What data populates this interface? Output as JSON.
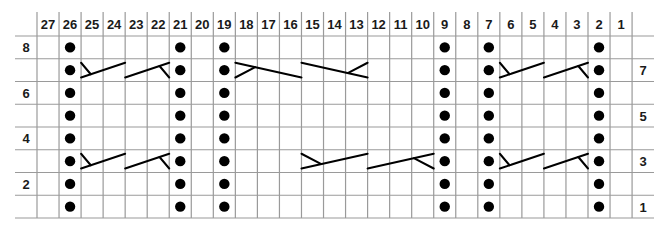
{
  "chart": {
    "title": "",
    "columns": [
      "27",
      "26",
      "25",
      "24",
      "23",
      "22",
      "21",
      "20",
      "19",
      "18",
      "17",
      "16",
      "15",
      "14",
      "13",
      "12",
      "11",
      "10",
      "9",
      "8",
      "7",
      "6",
      "5",
      "4",
      "3",
      "2",
      "1"
    ],
    "row_count": 8,
    "left_row_labels": [
      {
        "row": 8,
        "label": "8"
      },
      {
        "row": 6,
        "label": "6"
      },
      {
        "row": 4,
        "label": "4"
      },
      {
        "row": 2,
        "label": "2"
      }
    ],
    "right_row_labels": [
      {
        "row": 7,
        "label": "7"
      },
      {
        "row": 5,
        "label": "5"
      },
      {
        "row": 3,
        "label": "3"
      },
      {
        "row": 1,
        "label": "1"
      }
    ],
    "purl_columns": [
      26,
      21,
      19,
      9,
      7,
      2
    ],
    "purl_rows": [
      1,
      2,
      3,
      4,
      5,
      6,
      7,
      8
    ],
    "cables": [
      {
        "row": 7,
        "from_col": 25,
        "to_col": 24,
        "type": "right-twist-tick-left"
      },
      {
        "row": 7,
        "from_col": 23,
        "to_col": 22,
        "type": "right-twist-tick-right"
      },
      {
        "row": 7,
        "from_col": 18,
        "to_col": 16,
        "type": "left-cross-tick-left"
      },
      {
        "row": 7,
        "from_col": 15,
        "to_col": 13,
        "type": "left-cross-tick-right"
      },
      {
        "row": 7,
        "from_col": 6,
        "to_col": 5,
        "type": "right-twist-tick-left"
      },
      {
        "row": 7,
        "from_col": 4,
        "to_col": 3,
        "type": "right-twist-tick-right"
      },
      {
        "row": 3,
        "from_col": 25,
        "to_col": 24,
        "type": "right-twist-tick-left"
      },
      {
        "row": 3,
        "from_col": 23,
        "to_col": 22,
        "type": "right-twist-tick-right"
      },
      {
        "row": 3,
        "from_col": 15,
        "to_col": 13,
        "type": "right-cross-tick-left"
      },
      {
        "row": 3,
        "from_col": 12,
        "to_col": 10,
        "type": "right-cross-tick-right"
      },
      {
        "row": 3,
        "from_col": 6,
        "to_col": 5,
        "type": "right-twist-tick-left"
      },
      {
        "row": 3,
        "from_col": 4,
        "to_col": 3,
        "type": "right-twist-tick-right"
      }
    ],
    "colors": {
      "grid": "#9a9a9a",
      "ink": "#000000",
      "text": "#1a1a1a",
      "background": "#ffffff"
    }
  }
}
